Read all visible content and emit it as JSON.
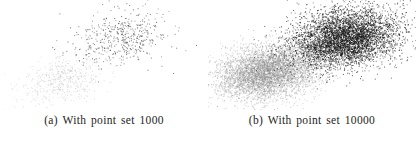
{
  "figure": {
    "background_color": "#ffffff",
    "panel_count": 2,
    "width": 416,
    "height": 148
  },
  "panels": [
    {
      "id": "panel-a",
      "caption": "(a) With point set 1000",
      "label": "(a)",
      "point_total": 1000
    },
    {
      "id": "panel-b",
      "caption": "(b) With point set 10000",
      "label": "(b)",
      "point_total": 10000
    }
  ],
  "chart_data": [
    {
      "type": "scatter",
      "title": "(a) With point set 1000",
      "xlabel": "",
      "ylabel": "",
      "xlim": [
        0,
        208
      ],
      "ylim": [
        0,
        110
      ],
      "grid": false,
      "axes_visible": false,
      "legend": "none",
      "total_points": 1000,
      "series": [
        {
          "name": "light-cluster",
          "color": "#b9b9b9",
          "point_count": 500,
          "center": [
            62,
            80
          ],
          "std_x": 21,
          "std_y": 12,
          "rotation_deg": -12,
          "point_size": 1.0,
          "opacity": 0.55
        },
        {
          "name": "dark-cluster",
          "color": "#4a4a4a",
          "point_count": 500,
          "center": [
            118,
            38
          ],
          "std_x": 24,
          "std_y": 13,
          "rotation_deg": -12,
          "point_size": 1.0,
          "opacity": 0.8
        }
      ]
    },
    {
      "type": "scatter",
      "title": "(b) With point set 10000",
      "xlabel": "",
      "ylabel": "",
      "xlim": [
        0,
        208
      ],
      "ylim": [
        0,
        110
      ],
      "grid": false,
      "axes_visible": false,
      "legend": "none",
      "total_points": 10000,
      "series": [
        {
          "name": "gray-cluster",
          "color": "#8a8a8a",
          "point_count": 5000,
          "center": [
            58,
            72
          ],
          "std_x": 25,
          "std_y": 13,
          "rotation_deg": -10,
          "point_size": 1.0,
          "opacity": 0.5
        },
        {
          "name": "black-cluster",
          "color": "#101010",
          "point_count": 5000,
          "center": [
            137,
            38
          ],
          "std_x": 27,
          "std_y": 14,
          "rotation_deg": -10,
          "point_size": 1.0,
          "opacity": 0.75
        }
      ]
    }
  ]
}
